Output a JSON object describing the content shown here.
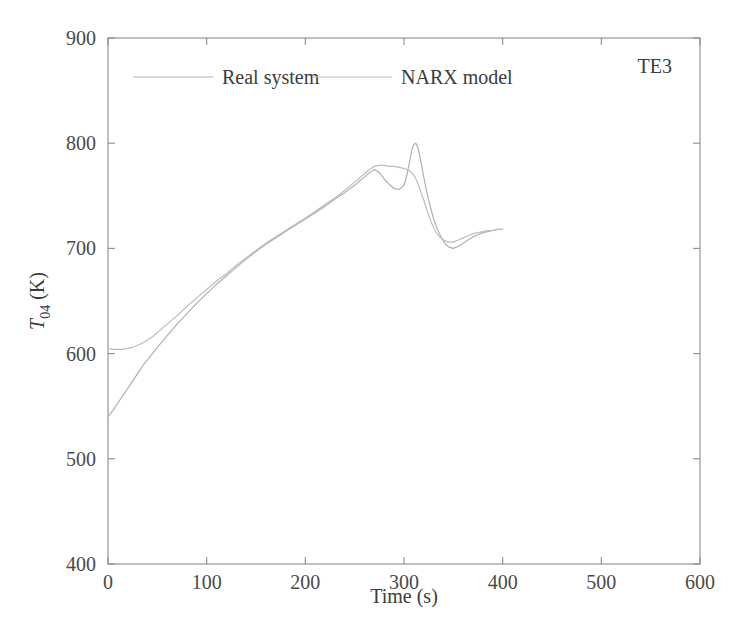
{
  "figure": {
    "annotation": "TE3",
    "background": "#ffffff",
    "frame_color": "#8c8c8c",
    "series_color": "#b9b9b9"
  },
  "axes": {
    "x": {
      "label": "Time (s)",
      "unit": "s",
      "ticks": [
        "0",
        "100",
        "200",
        "300",
        "400",
        "500",
        "600"
      ],
      "min": 0,
      "max": 600
    },
    "y": {
      "label_main": "T",
      "label_sub": "04",
      "label_unit": "(K)",
      "label_full": "T04 (K)",
      "ticks": [
        "400",
        "500",
        "600",
        "700",
        "800",
        "900"
      ],
      "min": 400,
      "max": 900
    }
  },
  "legend": {
    "entries": [
      {
        "label": "Real system",
        "color": "#b0b0b0"
      },
      {
        "label": "NARX model",
        "color": "#bdbdbd"
      }
    ]
  },
  "chart_data": {
    "type": "line",
    "title": "",
    "xlabel": "Time (s)",
    "ylabel": "T04 (K)",
    "xlim": [
      0,
      600
    ],
    "ylim": [
      400,
      900
    ],
    "xticks": [
      0,
      100,
      200,
      300,
      400,
      500,
      600
    ],
    "yticks": [
      400,
      500,
      600,
      700,
      800,
      900
    ],
    "grid": false,
    "legend_position": "top-center",
    "annotations": [
      {
        "text": "TE3",
        "x": 555,
        "y": 875
      }
    ],
    "series": [
      {
        "name": "Real system",
        "color": "#b0b0b0",
        "x": [
          0,
          5,
          10,
          15,
          20,
          25,
          30,
          35,
          40,
          45,
          50,
          60,
          70,
          80,
          90,
          100,
          110,
          120,
          130,
          140,
          150,
          160,
          170,
          180,
          190,
          200,
          210,
          220,
          230,
          240,
          250,
          260,
          265,
          270,
          275,
          280,
          285,
          290,
          295,
          300,
          303,
          306,
          308,
          310,
          312,
          314,
          316,
          318,
          320,
          323,
          326,
          330,
          334,
          338,
          342,
          346,
          350,
          355,
          360,
          365,
          370,
          375,
          380,
          385,
          390,
          395,
          400
        ],
        "y": [
          540,
          546,
          553,
          560,
          567,
          574,
          581,
          588,
          594,
          600,
          606,
          617,
          628,
          638,
          648,
          657,
          666,
          674,
          682,
          690,
          697,
          704,
          710,
          716,
          722,
          728,
          734,
          740,
          747,
          753,
          760,
          768,
          772,
          775,
          772,
          766,
          761,
          757,
          756,
          760,
          770,
          784,
          794,
          799,
          800,
          796,
          788,
          778,
          768,
          754,
          742,
          728,
          718,
          710,
          704,
          701,
          700,
          702,
          705,
          708,
          711,
          713,
          715,
          716,
          717,
          718,
          718
        ]
      },
      {
        "name": "NARX model",
        "color": "#bdbdbd",
        "x": [
          0,
          5,
          10,
          15,
          20,
          25,
          30,
          35,
          40,
          45,
          50,
          60,
          70,
          80,
          90,
          100,
          110,
          120,
          130,
          140,
          150,
          160,
          170,
          180,
          190,
          200,
          210,
          220,
          230,
          240,
          250,
          260,
          265,
          270,
          275,
          280,
          285,
          290,
          295,
          300,
          305,
          308,
          311,
          314,
          317,
          320,
          324,
          328,
          332,
          336,
          340,
          345,
          350,
          355,
          360,
          365,
          370,
          375,
          380,
          385,
          390,
          395,
          400
        ],
        "y": [
          605,
          604,
          604,
          604,
          605,
          606,
          608,
          610,
          613,
          616,
          620,
          628,
          636,
          645,
          653,
          661,
          669,
          676,
          684,
          691,
          698,
          705,
          711,
          717,
          723,
          729,
          735,
          742,
          748,
          755,
          763,
          771,
          775,
          778,
          779,
          779,
          778,
          778,
          777,
          776,
          774,
          772,
          768,
          762,
          754,
          746,
          734,
          724,
          716,
          711,
          708,
          706,
          706,
          708,
          710,
          712,
          714,
          715,
          716,
          717,
          717,
          718,
          718
        ]
      }
    ]
  }
}
